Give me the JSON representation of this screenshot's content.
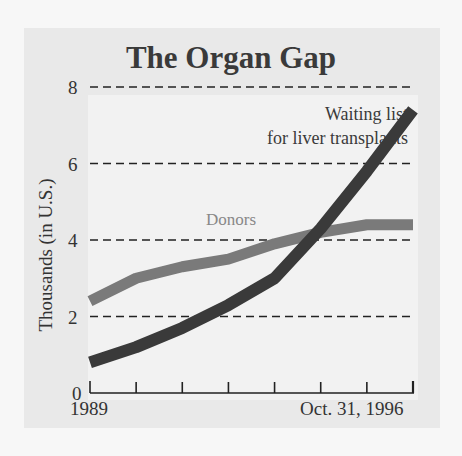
{
  "chart_data": {
    "type": "line",
    "title": "The Organ Gap",
    "xlabel": "",
    "ylabel": "Thousands (in U.S.)",
    "x": [
      1989,
      1990,
      1991,
      1992,
      1993,
      1994,
      1995,
      1996
    ],
    "x_tick_labels": [
      "1989",
      "Oct. 31, 1996"
    ],
    "y_ticks": [
      0,
      2,
      4,
      6,
      8
    ],
    "ylim": [
      0,
      8
    ],
    "grid": "horizontal dashed",
    "series": [
      {
        "name": "Donors",
        "color": "#7a7a7a",
        "values": [
          2.4,
          3.0,
          3.3,
          3.5,
          3.9,
          4.2,
          4.4,
          4.4
        ]
      },
      {
        "name": "Waiting list for liver transplants",
        "color": "#3a3a3a",
        "values": [
          0.8,
          1.2,
          1.7,
          2.3,
          3.0,
          4.3,
          5.8,
          7.4
        ]
      }
    ],
    "annotations": {
      "donors_label": "Donors",
      "waiting_label_line1": "Waiting list",
      "waiting_label_line2": "for liver transplants"
    }
  }
}
